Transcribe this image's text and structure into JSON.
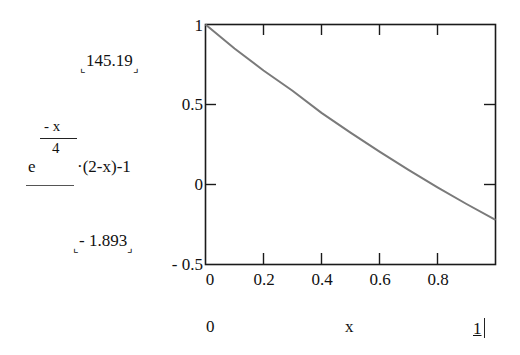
{
  "chart_data": {
    "type": "line",
    "title": "",
    "function_expression": "e^(-x/4)·(2-x)-1",
    "xlabel": "x",
    "ylabel": "e^(-x/4)·(2-x)-1",
    "xlim": [
      0,
      1
    ],
    "ylim": [
      -0.5,
      1
    ],
    "x_ticks": [
      "0",
      "0.2",
      "0.4",
      "0.6",
      "0.8"
    ],
    "y_ticks": [
      "1",
      "0.5",
      "0",
      "-0.5"
    ],
    "grid": false,
    "legend": null,
    "series": [
      {
        "name": "e^(-x/4)·(2-x)-1",
        "color": "#7a7a7a",
        "x": [
          0,
          0.1,
          0.2,
          0.3,
          0.4,
          0.5,
          0.6,
          0.7,
          0.8,
          0.9,
          1.0
        ],
        "y": [
          1.0,
          0.8503,
          0.7122,
          0.5855,
          0.4477,
          0.3236,
          0.205,
          0.0917,
          -0.0175,
          -0.1217,
          -0.2212
        ]
      }
    ],
    "y_range_markers": {
      "upper": "145.19",
      "lower": "- 1.893"
    },
    "x_range_markers": {
      "left": "0",
      "right": "1"
    }
  },
  "yaxis": {
    "ticks": [
      "1",
      "0.5",
      "0",
      "- 0.5"
    ],
    "expr": {
      "base": "e",
      "exp_num": "- x",
      "exp_den": "4",
      "rest": "·(2-x)-1"
    },
    "upper_marker": "145.19",
    "lower_marker": "- 1.893"
  },
  "xaxis": {
    "ticks": [
      "0",
      "0.2",
      "0.4",
      "0.6",
      "0.8"
    ],
    "var": "x",
    "left_marker": "0",
    "right_marker": "1"
  },
  "colors": {
    "axis": "#1a1a1a",
    "curve": "#7a7a7a",
    "background": "#ffffff"
  }
}
